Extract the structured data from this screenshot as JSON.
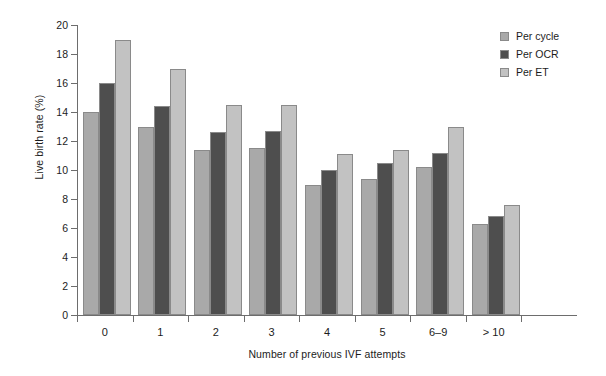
{
  "chart_data": {
    "type": "bar",
    "title": "",
    "subtitle": "",
    "xlabel": "Number of previous IVF attempts",
    "ylabel": "Live birth rate (%)",
    "categories": [
      "0",
      "1",
      "2",
      "3",
      "4",
      "5",
      "6–9",
      "> 10"
    ],
    "series": [
      {
        "name": "Per cycle",
        "color": "#a9a9a9",
        "values": [
          14.0,
          13.0,
          11.4,
          11.5,
          9.0,
          9.35,
          10.2,
          6.3
        ]
      },
      {
        "name": "Per OCR",
        "color": "#4e4e4e",
        "values": [
          16.0,
          14.4,
          12.6,
          12.7,
          10.0,
          10.5,
          11.2,
          6.85
        ]
      },
      {
        "name": "Per ET",
        "color": "#c2c2c2",
        "values": [
          19.0,
          17.0,
          14.5,
          14.5,
          11.1,
          11.35,
          13.0,
          7.6
        ]
      }
    ],
    "ylim": [
      0,
      20
    ],
    "ytick_step": 2,
    "yticks": [
      "20",
      "18",
      "16",
      "14",
      "12",
      "10",
      "8",
      "6",
      "4",
      "2",
      "0"
    ],
    "grid": false,
    "legend_position": "top-right",
    "axis_color": "#6d6d6d",
    "bar_edge_color": "#8a8a8a",
    "background": "#ffffff"
  }
}
